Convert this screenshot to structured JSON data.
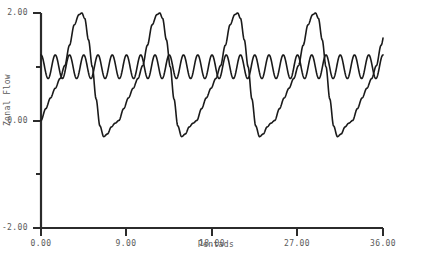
{
  "chart_data": {
    "type": "line",
    "title": "",
    "xlabel": "Pentads",
    "ylabel": "Zonal Flow",
    "xlim": [
      0,
      36
    ],
    "ylim": [
      -2.0,
      2.0
    ],
    "grid": false,
    "legend": null,
    "xticks": [
      "0.00",
      "9.00",
      "18.00",
      "27.00",
      "36.00"
    ],
    "xtick_values": [
      0,
      9,
      18,
      27,
      36
    ],
    "xminor_ticks": [
      4.5,
      13.5,
      22.5,
      31.5
    ],
    "yticks": [
      "2.00",
      "0.00",
      "-2.00"
    ],
    "ytick_values": [
      2.0,
      0.0,
      -2.0
    ],
    "yminor_ticks": [
      1.0,
      -1.0
    ],
    "line_color": "#1a1a1a",
    "axis_color": "#2b2b2b",
    "background_color": "#ffffff",
    "series": [
      {
        "name": "slow-zonal-flow",
        "description": "Large amplitude relaxation oscillation, period 8.2 pentads, range -0.3 to 2.0",
        "period": 8.2,
        "peak_value": 2.0,
        "trough_value": -0.3,
        "phase_offset": 0.0,
        "x": [
          0.0,
          0.5,
          1.0,
          1.5,
          2.0,
          2.5,
          3.0,
          3.5,
          4.0,
          4.3,
          4.6,
          5.0,
          5.4,
          5.8,
          6.2,
          6.6,
          7.0,
          7.4,
          7.8,
          8.2
        ],
        "values": [
          0.0,
          0.22,
          0.42,
          0.6,
          0.78,
          1.02,
          1.4,
          1.78,
          1.97,
          2.0,
          1.9,
          1.5,
          1.0,
          0.4,
          -0.1,
          -0.3,
          -0.25,
          -0.12,
          -0.05,
          0.0
        ]
      },
      {
        "name": "fast-oscillation",
        "description": "Small amplitude high frequency wave about a mean of 1.0, period 1.5 pentads",
        "period": 1.5,
        "mean_value": 1.0,
        "amplitude": 0.22,
        "x": [
          0,
          1.5,
          3.0,
          4.5,
          6.0,
          7.5,
          9.0,
          10.5,
          12.0,
          13.5,
          15.0,
          16.5,
          18.0,
          19.5,
          21.0,
          22.5,
          24.0,
          25.5,
          27.0,
          28.5,
          30.0,
          31.5,
          33.0,
          34.5,
          36.0
        ],
        "values": [
          1.0,
          1.0,
          1.0,
          1.0,
          1.0,
          1.0,
          1.0,
          1.0,
          1.0,
          1.0,
          1.0,
          1.0,
          1.0,
          1.0,
          1.0,
          1.0,
          1.0,
          1.0,
          1.0,
          1.0,
          1.0,
          1.0,
          1.0,
          1.0,
          1.0
        ]
      }
    ],
    "n_slow_peaks": 5,
    "slow_peak_x": [
      4.3,
      12.5,
      20.7,
      28.9,
      35.3
    ]
  }
}
